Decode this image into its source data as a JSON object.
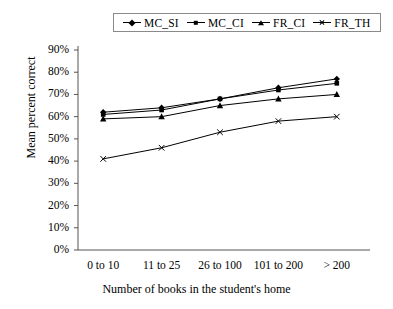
{
  "chart_data": {
    "type": "line",
    "title": "",
    "xlabel": "Number of books in the student's home",
    "ylabel": "Mean percent correct",
    "categories": [
      "0 to 10",
      "11 to 25",
      "26 to 100",
      "101 to 200",
      "> 200"
    ],
    "ylim": [
      0,
      90
    ],
    "ytick_labels": [
      "0%",
      "10%",
      "20%",
      "30%",
      "40%",
      "50%",
      "60%",
      "70%",
      "80%",
      "90%"
    ],
    "ytick_values": [
      0,
      10,
      20,
      30,
      40,
      50,
      60,
      70,
      80,
      90
    ],
    "grid": false,
    "legend_position": "top-center",
    "series": [
      {
        "name": "MC_SI",
        "marker": "diamond",
        "values": [
          62,
          64,
          68,
          73,
          77
        ]
      },
      {
        "name": "MC_CI",
        "marker": "square",
        "values": [
          61,
          63,
          68,
          72,
          75
        ]
      },
      {
        "name": "FR_CI",
        "marker": "triangle",
        "values": [
          59,
          60,
          65,
          68,
          70
        ]
      },
      {
        "name": "FR_TH",
        "marker": "cross",
        "values": [
          41,
          46,
          53,
          58,
          60
        ]
      }
    ],
    "line_color": "#000000",
    "axis_color": "#555555"
  }
}
